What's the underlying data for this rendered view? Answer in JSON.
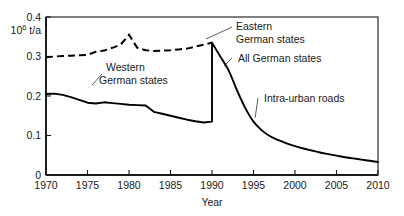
{
  "chart_data": {
    "type": "line",
    "title": "",
    "xlabel": "Year",
    "ylabel": "10^6 t/a",
    "ylabel_mantissa": "10",
    "ylabel_exponent": "6",
    "ylabel_unit": "t/a",
    "xlim": [
      1970,
      2010
    ],
    "ylim": [
      0,
      0.4
    ],
    "grid": false,
    "legend_position": "inline-annotations",
    "xticks": [
      1970,
      1975,
      1980,
      1985,
      1990,
      1995,
      2000,
      2005,
      2010
    ],
    "xtick_labels": [
      "1970",
      "1975",
      "1980",
      "1985",
      "1990",
      "1995",
      "2000",
      "2005",
      "2010"
    ],
    "yticks": [
      0,
      0.1,
      0.2,
      0.3,
      0.4
    ],
    "ytick_labels": [
      "0",
      "0.1",
      "0.2",
      "0.3",
      "0.4"
    ],
    "annotations": [
      {
        "id": "eastern",
        "text_line1": "Eastern",
        "text_line2": "German states",
        "points_to_year": 1990,
        "points_to_value": 0.335
      },
      {
        "id": "western",
        "text_line1": "Western",
        "text_line2": "German states",
        "points_to_year": 1977,
        "points_to_value": 0.185
      },
      {
        "id": "all-german",
        "text_line1": "All German states",
        "points_to_year": 1992,
        "points_to_value": 0.27
      },
      {
        "id": "intra-urban",
        "text_line1": "Intra-urban roads",
        "points_to_year": 1995.5,
        "points_to_value": 0.145
      }
    ],
    "series": [
      {
        "name": "Eastern German states",
        "style": "dashed",
        "x": [
          1970,
          1971,
          1972,
          1973,
          1974,
          1975,
          1976,
          1977,
          1978,
          1979,
          1980,
          1981,
          1982,
          1983,
          1984,
          1985,
          1986,
          1987,
          1988,
          1989,
          1990
        ],
        "values": [
          0.298,
          0.3,
          0.301,
          0.302,
          0.303,
          0.304,
          0.312,
          0.315,
          0.322,
          0.33,
          0.355,
          0.322,
          0.316,
          0.314,
          0.315,
          0.316,
          0.318,
          0.32,
          0.325,
          0.33,
          0.335
        ]
      },
      {
        "name": "Western German states",
        "style": "solid",
        "x": [
          1970,
          1971,
          1972,
          1973,
          1974,
          1975,
          1976,
          1977,
          1978,
          1979,
          1980,
          1981,
          1982,
          1983,
          1984,
          1985,
          1986,
          1987,
          1988,
          1989,
          1990
        ],
        "values": [
          0.205,
          0.206,
          0.203,
          0.197,
          0.19,
          0.183,
          0.181,
          0.184,
          0.182,
          0.18,
          0.178,
          0.177,
          0.176,
          0.16,
          0.155,
          0.15,
          0.145,
          0.14,
          0.136,
          0.133,
          0.135
        ]
      },
      {
        "name": "All German states",
        "style": "solid",
        "x": [
          1990,
          1991,
          1992,
          1993,
          1994,
          1995,
          1996,
          1997,
          1998,
          1999,
          2000,
          2001,
          2002,
          2003,
          2004,
          2005,
          2006,
          2007,
          2008,
          2009,
          2010
        ],
        "values": [
          0.335,
          0.3,
          0.265,
          0.215,
          0.17,
          0.135,
          0.113,
          0.098,
          0.088,
          0.08,
          0.073,
          0.067,
          0.062,
          0.057,
          0.053,
          0.049,
          0.045,
          0.042,
          0.039,
          0.036,
          0.033
        ]
      }
    ]
  }
}
